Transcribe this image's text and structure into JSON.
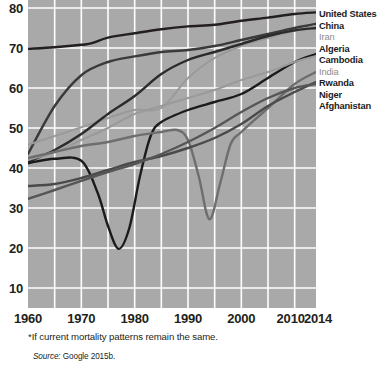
{
  "chart_data": {
    "type": "line",
    "title": "",
    "subtitle": "",
    "xlabel": "",
    "ylabel": "",
    "xlim": [
      1960,
      2014
    ],
    "ylim": [
      5,
      82
    ],
    "grid": true,
    "legend_position": "right",
    "y_ticks": [
      10,
      20,
      30,
      40,
      50,
      60,
      70,
      80
    ],
    "x_ticks": [
      1960,
      1970,
      1980,
      1990,
      2000,
      2010,
      2014
    ],
    "x_gridlines": [
      1965,
      1970,
      1975,
      1980,
      1985,
      1990,
      1995,
      2000,
      2005,
      2010
    ],
    "y_gridlines": [
      10,
      20,
      30,
      40,
      50,
      60,
      70,
      80
    ],
    "footnote": "*If current mortality patterns remain the same.",
    "source_label": "Source:",
    "source_text": "Google 2015b.",
    "series": [
      {
        "name": "United States",
        "color": "#231f20",
        "weight": "bold",
        "x": [
          1960,
          1965,
          1970,
          1972,
          1975,
          1980,
          1985,
          1990,
          1995,
          2000,
          2005,
          2010,
          2014
        ],
        "values": [
          69.8,
          70.2,
          70.8,
          71.2,
          72.6,
          73.7,
          74.7,
          75.4,
          75.8,
          76.8,
          77.6,
          78.5,
          78.9
        ]
      },
      {
        "name": "China",
        "color": "#3a3a3a",
        "weight": "bold",
        "x": [
          1960,
          1965,
          1970,
          1975,
          1980,
          1985,
          1990,
          1995,
          2000,
          2005,
          2010,
          2014
        ],
        "values": [
          43.5,
          55.5,
          63.2,
          66.5,
          67.9,
          69.0,
          69.5,
          70.5,
          72.0,
          73.5,
          75.0,
          76.0
        ]
      },
      {
        "name": "Iran",
        "color": "#9a9a9a",
        "weight": "light",
        "x": [
          1960,
          1965,
          1970,
          1975,
          1980,
          1985,
          1990,
          1995,
          2000,
          2005,
          2010,
          2014
        ],
        "values": [
          45.8,
          48.0,
          50.2,
          52.5,
          54.5,
          55.0,
          62.5,
          67.5,
          70.5,
          72.5,
          74.3,
          75.5
        ]
      },
      {
        "name": "Algeria",
        "color": "#2b2b2b",
        "weight": "bold",
        "x": [
          1960,
          1965,
          1970,
          1975,
          1980,
          1985,
          1990,
          1995,
          2000,
          2005,
          2010,
          2014
        ],
        "values": [
          41.5,
          44.5,
          48.5,
          53.5,
          58.0,
          63.5,
          67.0,
          69.0,
          71.0,
          73.0,
          74.4,
          75.0
        ]
      },
      {
        "name": "Cambodia",
        "color": "#1b1b1b",
        "weight": "bold",
        "x": [
          1960,
          1965,
          1970,
          1973,
          1975,
          1977,
          1979,
          1981,
          1983,
          1985,
          1990,
          1995,
          2000,
          2005,
          2010,
          2014
        ],
        "values": [
          41.2,
          42.3,
          41.8,
          34.0,
          25.5,
          19.8,
          25.0,
          38.0,
          48.0,
          51.5,
          54.5,
          56.5,
          58.5,
          62.5,
          66.5,
          68.5
        ]
      },
      {
        "name": "India",
        "color": "#9a9a9a",
        "weight": "light",
        "x": [
          1960,
          1965,
          1970,
          1975,
          1980,
          1985,
          1990,
          1995,
          2000,
          2005,
          2010,
          2014
        ],
        "values": [
          42.0,
          44.0,
          47.0,
          50.0,
          53.5,
          55.5,
          57.5,
          59.5,
          62.0,
          64.0,
          66.5,
          68.0
        ]
      },
      {
        "name": "Rwanda",
        "color": "#6e6e6e",
        "weight": "bold",
        "x": [
          1960,
          1965,
          1970,
          1975,
          1980,
          1985,
          1988,
          1990,
          1992,
          1994,
          1996,
          1998,
          2000,
          2005,
          2010,
          2014
        ],
        "values": [
          42.5,
          44.0,
          45.5,
          46.5,
          48.0,
          49.0,
          49.5,
          47.0,
          38.0,
          27.2,
          36.0,
          46.0,
          49.0,
          55.0,
          61.0,
          64.0
        ]
      },
      {
        "name": "Niger",
        "color": "#4a4a4a",
        "weight": "bold",
        "x": [
          1960,
          1965,
          1970,
          1975,
          1980,
          1985,
          1990,
          1995,
          2000,
          2005,
          2010,
          2014
        ],
        "values": [
          35.5,
          36.0,
          37.5,
          39.5,
          41.5,
          43.0,
          45.0,
          47.5,
          51.0,
          55.5,
          59.0,
          61.5
        ]
      },
      {
        "name": "Afghanistan",
        "color": "#565656",
        "weight": "bold",
        "x": [
          1960,
          1965,
          1970,
          1975,
          1980,
          1985,
          1990,
          1995,
          2000,
          2005,
          2010,
          2014
        ],
        "values": [
          32.3,
          34.5,
          36.8,
          39.0,
          41.0,
          43.5,
          46.5,
          50.0,
          54.0,
          57.5,
          60.0,
          61.0
        ]
      }
    ]
  },
  "legend": {
    "items": [
      {
        "label": "United States",
        "style": "bold"
      },
      {
        "label": "China",
        "style": "bold"
      },
      {
        "label": "Iran",
        "style": "light"
      },
      {
        "label": "Algeria",
        "style": "bold"
      },
      {
        "label": "Cambodia",
        "style": "bold"
      },
      {
        "label": "India",
        "style": "light"
      },
      {
        "label": "Rwanda",
        "style": "bold"
      },
      {
        "label": "Niger",
        "style": "bold"
      },
      {
        "label": "Afghanistan",
        "style": "bold"
      }
    ]
  },
  "notes": {
    "footnote": "*If current mortality patterns remain the same.",
    "source_label": "Source:",
    "source_text": "Google 2015b."
  }
}
